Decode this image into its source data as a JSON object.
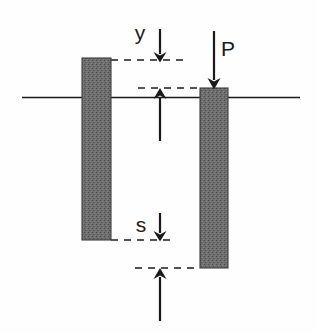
{
  "diagram": {
    "canvas": {
      "width": 317,
      "height": 333,
      "background": "#fefefe"
    },
    "colors": {
      "bar_fill": "#6b6b6b",
      "bar_outline": "#3a3a3a",
      "line": "#1a1a1a",
      "dashed": "#1a1a1a",
      "text": "#1a1a1a"
    },
    "labels": {
      "y": "y",
      "P": "P",
      "s": "s"
    },
    "bars": [
      {
        "name": "left-bar",
        "x": 82,
        "y": 58,
        "width": 29,
        "height": 182
      },
      {
        "name": "right-bar",
        "x": 200,
        "y": 88,
        "width": 28,
        "height": 180
      }
    ],
    "ground_line": {
      "x1": 22,
      "y1": 97,
      "x2": 300,
      "y2": 97
    },
    "dashed_lines": [
      {
        "name": "top-dashed",
        "x1": 111,
        "y1": 60,
        "x2": 186,
        "y2": 60
      },
      {
        "name": "mid-dashed",
        "x1": 138,
        "y1": 88,
        "x2": 200,
        "y2": 88
      },
      {
        "name": "left-bottom-dashed",
        "x1": 111,
        "y1": 240,
        "x2": 172,
        "y2": 240
      },
      {
        "name": "bottom-dashed",
        "x1": 136,
        "y1": 268,
        "x2": 200,
        "y2": 268
      }
    ],
    "arrows": [
      {
        "name": "y-arrow",
        "direction": "down",
        "x": 160,
        "from": 30,
        "to": 61
      },
      {
        "name": "p-arrow",
        "direction": "down",
        "x": 214,
        "from": 32,
        "to": 89
      },
      {
        "name": "upper-reaction-arrow",
        "direction": "up",
        "x": 160,
        "from": 141,
        "to": 89
      },
      {
        "name": "s-arrow",
        "direction": "down",
        "x": 160,
        "from": 214,
        "to": 241
      },
      {
        "name": "lower-reaction-arrow",
        "direction": "up",
        "x": 160,
        "from": 321,
        "to": 269
      }
    ],
    "label_positions": {
      "y": {
        "x": 140,
        "y": 38
      },
      "P": {
        "x": 226,
        "y": 54
      },
      "s": {
        "x": 141,
        "y": 230
      }
    }
  }
}
